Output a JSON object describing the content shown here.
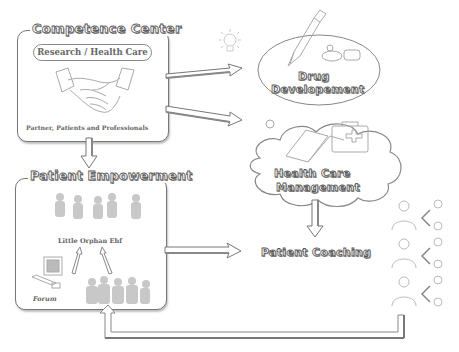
{
  "competence_center": {
    "title": "Competence Center",
    "subtitle": "Research / Health Care",
    "caption": "Partner, Patients and Professionals",
    "image": "handshake-icon"
  },
  "drug_development": {
    "title_line1": "Drug",
    "title_line2": "Developement",
    "image": "syringe-pills-icon"
  },
  "health_care_management": {
    "title_line1": "Health Care",
    "title_line2": "Management",
    "image": "book-medical-case-icon"
  },
  "patient_empowerment": {
    "title": "Patient Empowerment",
    "group_label": "Little Orphan Ehf",
    "forum_label": "Forum",
    "images": [
      "children-silhouettes-icon",
      "computer-icon",
      "family-group-icon"
    ]
  },
  "patient_coaching": {
    "title": "Patient Coaching",
    "image": "coach-network-icon"
  },
  "decor": {
    "lightbulb": "lightbulb-icon"
  },
  "colors": {
    "stroke": "#777777",
    "text_fill": "#ffffff",
    "text_outline": "#555555",
    "faint": "#bbbbbb"
  }
}
